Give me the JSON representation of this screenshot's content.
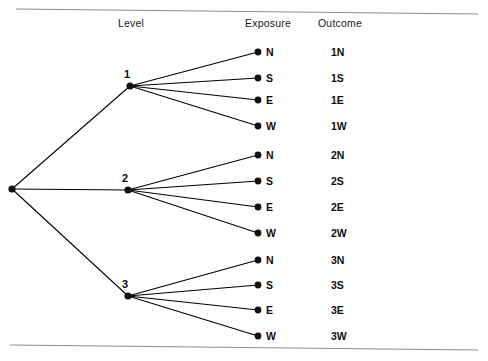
{
  "figure": {
    "width": 488,
    "height": 361,
    "background": "#ffffff",
    "line_color": "#000000",
    "rule_color": "#8d8d8d",
    "text_color": "#0d0d0d"
  },
  "headers": [
    {
      "label": "Level",
      "x": 118,
      "y": 27
    },
    {
      "label": "Exposure",
      "x": 245,
      "y": 27
    },
    {
      "label": "Outcome",
      "x": 318,
      "y": 27
    }
  ],
  "rules": [
    {
      "name": "top-rule",
      "x1": 16,
      "y1": 9,
      "x2": 478,
      "y2": 14
    },
    {
      "name": "bottom-rule",
      "x1": 10,
      "y1": 345,
      "x2": 478,
      "y2": 350
    }
  ],
  "root": {
    "name": "root",
    "x": 12,
    "y": 189,
    "r": 3.6
  },
  "levels": [
    {
      "id": "1",
      "label": "1",
      "x": 130,
      "y": 86,
      "r": 3.6,
      "label_x": 124,
      "label_y": 78
    },
    {
      "id": "2",
      "label": "2",
      "x": 128,
      "y": 190,
      "r": 3.6,
      "label_x": 122,
      "label_y": 182
    },
    {
      "id": "3",
      "label": "3",
      "x": 128,
      "y": 296,
      "r": 3.6,
      "label_x": 122,
      "label_y": 288
    }
  ],
  "exposure_x": 258,
  "exposure_label_x": 266,
  "outcome_x": 331,
  "leaf_radius": 3.4,
  "leaves": [
    {
      "level": "1",
      "exposure": "N",
      "outcome": "1N",
      "y": 52
    },
    {
      "level": "1",
      "exposure": "S",
      "outcome": "1S",
      "y": 78
    },
    {
      "level": "1",
      "exposure": "E",
      "outcome": "1E",
      "y": 100
    },
    {
      "level": "1",
      "exposure": "W",
      "outcome": "1W",
      "y": 126
    },
    {
      "level": "2",
      "exposure": "N",
      "outcome": "2N",
      "y": 155
    },
    {
      "level": "2",
      "exposure": "S",
      "outcome": "2S",
      "y": 181
    },
    {
      "level": "2",
      "exposure": "E",
      "outcome": "2E",
      "y": 207
    },
    {
      "level": "2",
      "exposure": "W",
      "outcome": "2W",
      "y": 233
    },
    {
      "level": "3",
      "exposure": "N",
      "outcome": "3N",
      "y": 260
    },
    {
      "level": "3",
      "exposure": "S",
      "outcome": "3S",
      "y": 285
    },
    {
      "level": "3",
      "exposure": "E",
      "outcome": "3E",
      "y": 310
    },
    {
      "level": "3",
      "exposure": "W",
      "outcome": "3W",
      "y": 336
    }
  ]
}
